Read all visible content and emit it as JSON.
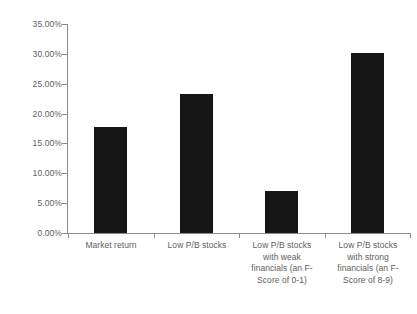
{
  "chart_data": {
    "type": "bar",
    "title": "",
    "xlabel": "",
    "ylabel": "",
    "ylim": [
      0,
      0.35
    ],
    "grid": false,
    "legend": null,
    "categories": [
      "Market return",
      "Low P/B stocks",
      "Low P/B stocks with weak financials (an F-Score of 0-1)",
      "Low P/B stocks with strong financials (an F-Score of 8-9)"
    ],
    "category_lines": [
      [
        "Market return"
      ],
      [
        "Low P/B stocks"
      ],
      [
        "Low P/B stocks",
        "with weak",
        "financials (an F-",
        "Score of 0-1)"
      ],
      [
        "Low P/B stocks",
        "with strong",
        "financials (an F-",
        "Score of 8-9)"
      ]
    ],
    "values": [
      0.178,
      0.233,
      0.07,
      0.302
    ],
    "value_labels": [
      "17.80%",
      "23.30%",
      "7.00%",
      "30.20%"
    ],
    "y_ticks": [
      0,
      0.05,
      0.1,
      0.15,
      0.2,
      0.25,
      0.3,
      0.35
    ],
    "y_tick_labels": [
      "0.00%",
      "5.00%",
      "10.00%",
      "15.00%",
      "20.00%",
      "25.00%",
      "30.00%",
      "35.00%"
    ],
    "colors": {
      "bar": "#161616",
      "axis": "#8c8c8c",
      "text": "#5e5e5e",
      "background": "#ffffff"
    }
  }
}
